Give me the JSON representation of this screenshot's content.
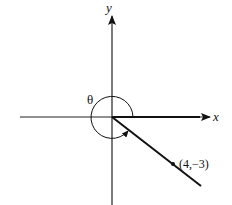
{
  "diagram": {
    "title": "",
    "axes": {
      "x_label": "x",
      "y_label": "y"
    },
    "angle": {
      "label": "θ",
      "description": "angle measured counterclockwise from positive x-axis to terminal ray"
    },
    "point": {
      "label": "(4,−3)",
      "x": 4,
      "y": -3
    },
    "colors": {
      "stroke": "#111111",
      "background": "#ffffff"
    }
  }
}
